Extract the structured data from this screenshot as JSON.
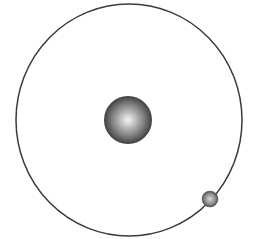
{
  "diagram": {
    "type": "atom-model",
    "background": "#ffffff",
    "orbit": {
      "cx": 129,
      "cy": 120,
      "rx": 113,
      "ry": 116,
      "stroke": "#3a3a3a",
      "stroke_width": 1.5
    },
    "nucleus": {
      "cx": 128,
      "cy": 120,
      "r": 24,
      "highlight": "#f4f4f4",
      "mid": "#8a8a8a",
      "edge": "#2e2e2e"
    },
    "electron": {
      "cx": 210,
      "cy": 199,
      "r": 8,
      "highlight": "#d8d8d8",
      "mid": "#8c8c8c",
      "edge": "#3a3a3a"
    }
  }
}
